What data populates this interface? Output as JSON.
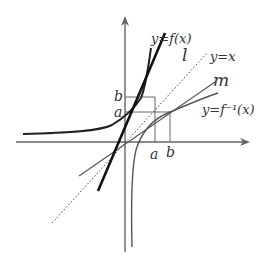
{
  "diagram": {
    "type": "function-inverse-tangent-diagram",
    "labels": {
      "f_curve": "y=f(x)",
      "inverse_curve": "y=f⁻¹(x)",
      "identity_line": "y=x",
      "line_l": "l",
      "line_m": "m",
      "tick_a_x": "a",
      "tick_b_x": "b",
      "tick_a_y": "a",
      "tick_b_y": "b"
    },
    "colors": {
      "axis": "#666666",
      "f_curve": "#222222",
      "inverse_curve": "#555555",
      "line_l": "#111111",
      "line_m": "#555555",
      "identity_line": "#444444",
      "guide_lines": "#666666",
      "text": "#333333"
    },
    "elements": [
      "x-axis with arrow",
      "y-axis with arrow",
      "curve y=f(x) (bold)",
      "curve y=f^-1(x)",
      "tangent line l (thick)",
      "tangent line m",
      "dotted line y=x",
      "guide lines at x=a, x=b, y=a, y=b"
    ]
  }
}
